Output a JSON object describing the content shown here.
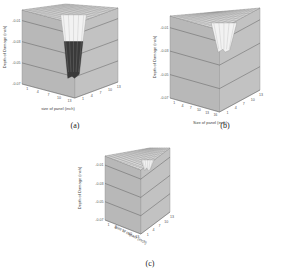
{
  "chart_data": [
    {
      "type": "surface3d",
      "caption": "(a)",
      "xlabel": "size of panel (inch)",
      "ylabel": "Depth of Damage (inch)",
      "x_ticks": [
        "1",
        "4",
        "7",
        "10",
        "13"
      ],
      "depth_ticks": [
        "1",
        "4",
        "7",
        "10",
        "13"
      ],
      "z_ticks": [
        "-0.01",
        "-0.03",
        "-0.05",
        "-0.07"
      ],
      "zlim": [
        -0.07,
        0
      ],
      "grid": true,
      "damage": {
        "center_x": 7,
        "center_depth": 7,
        "max_depth": -0.06,
        "width": 4
      },
      "colors": {
        "face": "#b8b8b8",
        "top": "#d8d8d8",
        "crater_light": "#f2f2f2",
        "crater_dark": "#3a3a3a"
      }
    },
    {
      "type": "surface3d",
      "caption": "(b)",
      "xlabel": "Size of panel (inch)",
      "ylabel": "Depth of Damage (inch)",
      "x_ticks": [
        "1",
        "4",
        "7",
        "10",
        "13",
        "16"
      ],
      "depth_ticks": [
        "1",
        "4",
        "7",
        "10",
        "13"
      ],
      "z_ticks": [
        "-0.01",
        "-0.03",
        "-0.05",
        "-0.07"
      ],
      "zlim": [
        -0.07,
        0
      ],
      "grid": true,
      "damage": {
        "center_x": 8,
        "center_depth": 7,
        "max_depth": -0.025,
        "width": 4
      },
      "colors": {
        "face": "#b8b8b8",
        "top": "#d8d8d8",
        "crater_light": "#f2f2f2",
        "crater_dark": "#9a9a9a"
      }
    },
    {
      "type": "surface3d",
      "caption": "(c)",
      "xlabel": "Size of impact (inch)",
      "ylabel": "Depth of Damage (inch)",
      "x_ticks": [
        "1",
        "4",
        "7",
        "10",
        "13"
      ],
      "depth_ticks": [
        "1",
        "4",
        "7",
        "10",
        "13"
      ],
      "z_ticks": [
        "-0.01",
        "-0.03",
        "-0.05",
        "-0.07"
      ],
      "zlim": [
        -0.07,
        0
      ],
      "grid": true,
      "damage": {
        "center_x": 7,
        "center_depth": 7,
        "max_depth": -0.012,
        "width": 2
      },
      "colors": {
        "face": "#b8b8b8",
        "top": "#d8d8d8",
        "crater_light": "#f2f2f2",
        "crater_dark": "#aaaaaa"
      }
    }
  ]
}
